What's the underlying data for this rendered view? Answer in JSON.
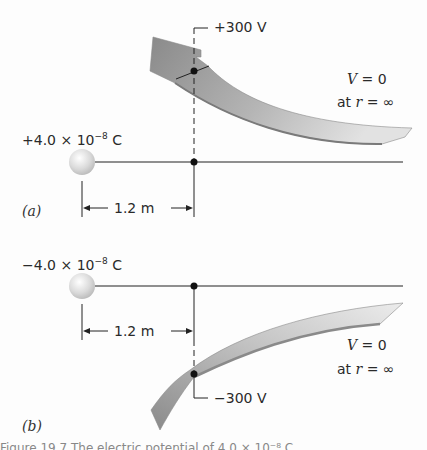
{
  "figure": {
    "panel_a": {
      "label": "(a)",
      "charge": {
        "prefix": "+4.0 × 10",
        "exponent": "−8",
        "unit": " C"
      },
      "distance": "1.2 m",
      "potential_label": "+300 V",
      "reference": {
        "line1_var": "V",
        "line1_rest": " = 0",
        "line2_pre": "at ",
        "line2_var": "r",
        "line2_rest": " = ∞"
      }
    },
    "panel_b": {
      "label": "(b)",
      "charge": {
        "prefix": "−4.0 × 10",
        "exponent": "−8",
        "unit": " C"
      },
      "distance": "1.2 m",
      "potential_label": "−300 V",
      "reference": {
        "line1_var": "V",
        "line1_rest": " = 0",
        "line2_pre": "at ",
        "line2_var": "r",
        "line2_rest": " = ∞"
      }
    },
    "caption_fragment": "Figure 19.7 The electric potential of 4.0 × 10⁻⁸ C..."
  },
  "colors": {
    "arrow_dark": "#8e8e8e",
    "arrow_light": "#d6d6d6",
    "line": "#222222",
    "sphere": "#dcdcdc"
  }
}
